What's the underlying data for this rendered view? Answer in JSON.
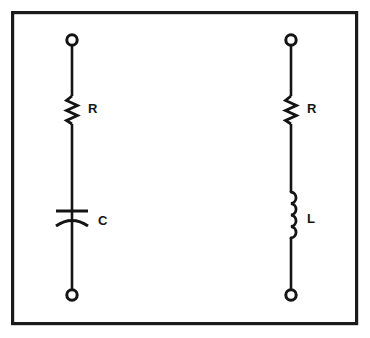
{
  "figure": {
    "name": "rc-and-rl-series-circuit-diagram",
    "background_color": "#ffffff",
    "ink_color": "#141414",
    "frame": {
      "x": 11,
      "y": 11,
      "width": 347,
      "height": 314,
      "stroke_color": "#1a1a1a",
      "stroke_width": 3.2
    }
  },
  "circuits": [
    {
      "id": "rc-series",
      "name": "rc-series-branch",
      "center_x": 72,
      "top_terminal": {
        "cx": 72,
        "cy": 40,
        "r": 5.2,
        "label": "terminal"
      },
      "bottom_terminal": {
        "cx": 72,
        "cy": 295,
        "r": 5.2,
        "label": "terminal"
      },
      "components": [
        {
          "type": "resistor",
          "symbol": "zigzag",
          "label": "R",
          "label_x": 86,
          "label_y": 110,
          "y_start": 96,
          "y_end": 124,
          "peaks": 6,
          "amplitude": 5.5
        },
        {
          "type": "capacitor",
          "symbol": "polarized-plate-and-arc",
          "label": "C",
          "label_x": 98,
          "label_y": 222,
          "plate_y": 211,
          "plate_half_width": 16,
          "arc_y": 219,
          "arc_depth": 7,
          "arc_half_width": 16
        }
      ]
    },
    {
      "id": "rl-series",
      "name": "rl-series-branch",
      "center_x": 291,
      "top_terminal": {
        "cx": 291,
        "cy": 40,
        "r": 5.2,
        "label": "terminal"
      },
      "bottom_terminal": {
        "cx": 291,
        "cy": 295,
        "r": 5.2,
        "label": "terminal"
      },
      "components": [
        {
          "type": "resistor",
          "symbol": "zigzag",
          "label": "R",
          "label_x": 305,
          "label_y": 110,
          "y_start": 96,
          "y_end": 124,
          "peaks": 6,
          "amplitude": 5.5
        },
        {
          "type": "inductor",
          "symbol": "coil-loops",
          "label": "L",
          "label_x": 305,
          "label_y": 220,
          "y_start": 192,
          "y_end": 238,
          "loops": 4,
          "loop_radius": 5.8
        }
      ]
    }
  ],
  "labels": {
    "resistor_left": "R",
    "capacitor_left": "C",
    "resistor_right": "R",
    "inductor_right": "L"
  }
}
